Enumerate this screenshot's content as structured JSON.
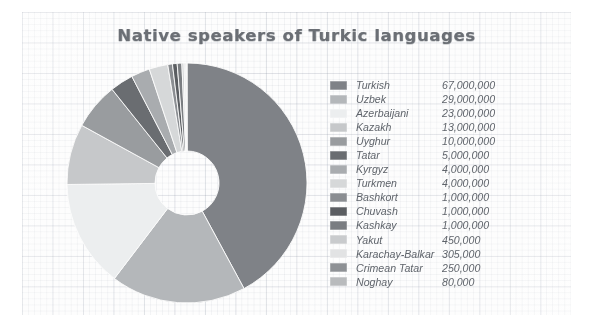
{
  "chart_data": {
    "type": "pie",
    "title": "Native speakers of Turkic languages",
    "variant": "donut",
    "legend_position": "right",
    "grid": false,
    "xlabel": "",
    "ylabel": "",
    "categories": [
      "Turkish",
      "Uzbek",
      "Azerbaijani",
      "Kazakh",
      "Uyghur",
      "Tatar",
      "Kyrgyz",
      "Turkmen",
      "Bashkort",
      "Chuvash",
      "Kashkay",
      "Yakut",
      "Karachay-Balkar",
      "Crimean Tatar",
      "Noghay"
    ],
    "values": [
      67000000,
      29000000,
      23000000,
      13000000,
      10000000,
      5000000,
      4000000,
      4000000,
      1000000,
      1000000,
      1000000,
      450000,
      305000,
      250000,
      80000
    ],
    "value_labels": [
      "67,000,000",
      "29,000,000",
      "23,000,000",
      "13,000,000",
      "10,000,000",
      "5,000,000",
      "4,000,000",
      "4,000,000",
      "1,000,000",
      "1,000,000",
      "1,000,000",
      "450,000",
      "305,000",
      "250,000",
      "80,000"
    ],
    "colors": [
      "#7f8287",
      "#b4b7ba",
      "#eceeef",
      "#c6c8ca",
      "#999c9f",
      "#6a6d71",
      "#a9acaf",
      "#d6d8d9",
      "#8b8e92",
      "#5b5e62",
      "#7a7d81",
      "#c9cbcd",
      "#e2e3e4",
      "#8e9195",
      "#b9bbbd"
    ]
  },
  "chart": {
    "title": "Native speakers of Turkic languages",
    "legend": [
      {
        "label": "Turkish",
        "value": "67,000,000",
        "color": "#7f8287"
      },
      {
        "label": "Uzbek",
        "value": "29,000,000",
        "color": "#b4b7ba"
      },
      {
        "label": "Azerbaijani",
        "value": "23,000,000",
        "color": "#eceeef"
      },
      {
        "label": "Kazakh",
        "value": "13,000,000",
        "color": "#c6c8ca"
      },
      {
        "label": "Uyghur",
        "value": "10,000,000",
        "color": "#999c9f"
      },
      {
        "label": "Tatar",
        "value": "5,000,000",
        "color": "#6a6d71"
      },
      {
        "label": "Kyrgyz",
        "value": "4,000,000",
        "color": "#a9acaf"
      },
      {
        "label": "Turkmen",
        "value": "4,000,000",
        "color": "#d6d8d9"
      },
      {
        "label": "Bashkort",
        "value": "1,000,000",
        "color": "#8b8e92"
      },
      {
        "label": "Chuvash",
        "value": "1,000,000",
        "color": "#5b5e62"
      },
      {
        "label": "Kashkay",
        "value": "1,000,000",
        "color": "#7a7d81"
      },
      {
        "label": "Yakut",
        "value": "450,000",
        "color": "#c9cbcd"
      },
      {
        "label": "Karachay-Balkar",
        "value": "305,000",
        "color": "#e2e3e4"
      },
      {
        "label": "Crimean Tatar",
        "value": "250,000",
        "color": "#8e9195"
      },
      {
        "label": "Noghay",
        "value": "80,000",
        "color": "#b9bbbd"
      }
    ]
  }
}
